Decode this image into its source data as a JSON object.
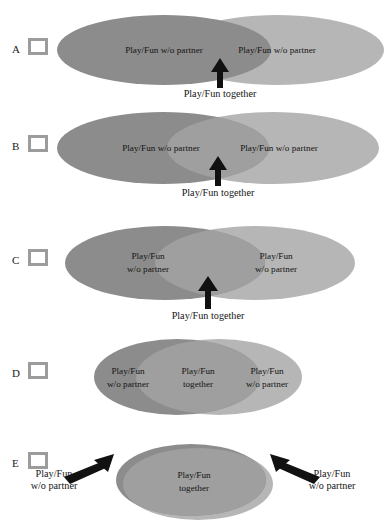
{
  "figure": {
    "panels": [
      {
        "letter": "A",
        "checkbox_checked": false,
        "left_ellipse_label": "Play/Fun w/o partner",
        "right_ellipse_label": "Play/Fun w/o partner",
        "overlap_caption": "Play/Fun together",
        "overlap": "none"
      },
      {
        "letter": "B",
        "checkbox_checked": false,
        "left_ellipse_label": "Play/Fun w/o partner",
        "right_ellipse_label": "Play/Fun w/o partner",
        "overlap_caption": "Play/Fun together",
        "overlap": "slight"
      },
      {
        "letter": "C",
        "checkbox_checked": false,
        "left_ellipse_label_line1": "Play/Fun",
        "left_ellipse_label_line2": "w/o partner",
        "right_ellipse_label_line1": "Play/Fun",
        "right_ellipse_label_line2": "w/o partner",
        "overlap_caption": "Play/Fun together",
        "overlap": "small"
      },
      {
        "letter": "D",
        "checkbox_checked": false,
        "left_ellipse_label_line1": "Play/Fun",
        "left_ellipse_label_line2": "w/o partner",
        "center_label_line1": "Play/Fun",
        "center_label_line2": "together",
        "right_ellipse_label_line1": "Play/Fun",
        "right_ellipse_label_line2": "w/o partner",
        "overlap": "large"
      },
      {
        "letter": "E",
        "checkbox_checked": false,
        "center_label_line1": "Play/Fun",
        "center_label_line2": "together",
        "left_caption_line1": "Play/Fun",
        "left_caption_line2": "w/o partner",
        "right_caption_line1": "Play/Fun",
        "right_caption_line2": "w/o partner",
        "overlap": "near-complete"
      }
    ],
    "colors": {
      "ellipse_dark": "#8c8c8c",
      "ellipse_light": "#b6b6b6",
      "ellipse_overlap": "#9f9f9f",
      "checkbox_border": "#9c9c9c",
      "text": "#141414",
      "arrow": "#111111",
      "background": "#ffffff"
    }
  }
}
